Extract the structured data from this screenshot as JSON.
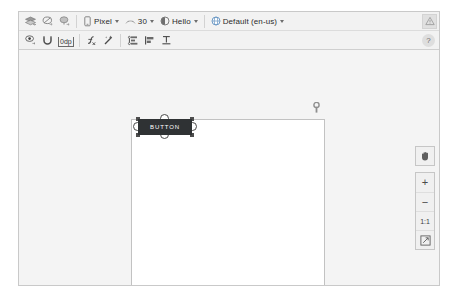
{
  "toolbar_primary": {
    "tools": [
      {
        "name": "design-mode-icon",
        "label": "Design Surface Mode"
      },
      {
        "name": "blueprint-mode-icon",
        "label": "Blueprint Mode"
      },
      {
        "name": "orientation-icon",
        "label": "Orientation"
      }
    ],
    "device_selector": {
      "label": "Pixel",
      "icon": "device-phone-icon"
    },
    "api_selector": {
      "label": "30",
      "icon": "api-level-icon"
    },
    "theme_selector": {
      "label": "Hello",
      "icon": "theme-icon"
    },
    "locale_selector": {
      "label": "Default (en-us)",
      "icon": "globe-icon"
    },
    "warning_button": {
      "name": "warning-indicator",
      "glyph": "!"
    }
  },
  "toolbar_secondary": {
    "tools": [
      {
        "name": "show-constraints-icon",
        "label": "Show Constraints"
      },
      {
        "name": "autoconnect-icon",
        "label": "Autoconnect"
      },
      {
        "name": "default-margin-value",
        "label": "0dp"
      },
      {
        "name": "clear-constraints-icon",
        "label": "Clear All Constraints"
      },
      {
        "name": "infer-constraints-icon",
        "label": "Infer Constraints"
      },
      {
        "name": "guidelines-icon",
        "label": "Guidelines"
      },
      {
        "name": "align-icon",
        "label": "Align"
      },
      {
        "name": "baseline-icon",
        "label": "Baseline"
      }
    ],
    "help_button": {
      "name": "help-icon",
      "glyph": "?"
    }
  },
  "canvas": {
    "widget": {
      "label": "BUTTON",
      "name": "button-widget"
    },
    "marker": {
      "name": "canvas-top-marker"
    }
  },
  "zoom_controls": {
    "pan": {
      "name": "pan-hand-icon",
      "label": "Pan"
    },
    "zoom_in": {
      "name": "zoom-in-button",
      "label": "+"
    },
    "zoom_out": {
      "name": "zoom-out-button",
      "label": "−"
    },
    "actual_size": {
      "name": "actual-size-button",
      "label": "1:1"
    },
    "fit_screen": {
      "name": "fit-to-screen-button",
      "label": "Fit to Screen"
    }
  },
  "colors": {
    "widget_fill": "#2f3234",
    "surface": "#f4f4f4",
    "toolbar": "#f2f2f2",
    "canvas": "#ffffff"
  }
}
